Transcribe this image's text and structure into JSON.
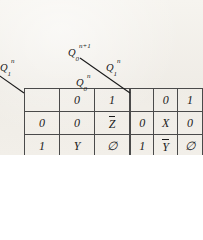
{
  "figure": {
    "kind": "excitation-tables",
    "background_color": "#f1eee8",
    "ink_color": "#1a1a1a"
  },
  "tables": [
    {
      "id": "left",
      "corner": {
        "output_label_base": "Q",
        "output_label_sub": "1",
        "output_label_sup": "n+1",
        "col_var_base": "Q",
        "col_var_sub": "1",
        "col_var_sup": "n",
        "row_var_base": "Q",
        "row_var_sub": "0",
        "row_var_sup": "n"
      },
      "col_headers": [
        "0",
        "1"
      ],
      "row_headers": [
        "0",
        "1"
      ],
      "cells": [
        [
          {
            "text": "0",
            "overline": false,
            "italic": false
          },
          {
            "text": "Z",
            "overline": true,
            "italic": true
          }
        ],
        [
          {
            "text": "Y",
            "overline": false,
            "italic": true
          },
          {
            "text": "∅",
            "overline": false,
            "italic": false
          }
        ]
      ]
    },
    {
      "id": "right",
      "corner": {
        "output_label_base": "Q",
        "output_label_sub": "0",
        "output_label_sup": "n+1",
        "col_var_base": "Q",
        "col_var_sub": "1",
        "col_var_sup": "n",
        "row_var_base": "Q",
        "row_var_sub": "0",
        "row_var_sup": "n"
      },
      "col_headers": [
        "0",
        "1"
      ],
      "row_headers": [
        "0",
        "1"
      ],
      "cells": [
        [
          {
            "text": "X",
            "overline": false,
            "italic": true
          },
          {
            "text": "0",
            "overline": false,
            "italic": false
          }
        ],
        [
          {
            "text": "Y",
            "overline": true,
            "italic": true
          },
          {
            "text": "∅",
            "overline": false,
            "italic": false
          }
        ]
      ]
    }
  ]
}
